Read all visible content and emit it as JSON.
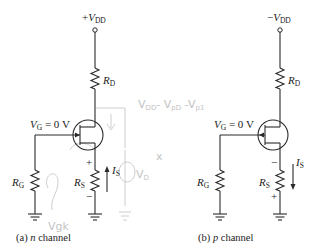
{
  "circuits": [
    {
      "id": "n-channel",
      "supply": {
        "sign": "+",
        "name": "V",
        "sub": "DD"
      },
      "drain_resistor": {
        "name": "R",
        "sub": "D"
      },
      "gate_label": {
        "name": "V",
        "sub": "G",
        "value": " = 0 V"
      },
      "gate_resistor": {
        "name": "R",
        "sub": "G"
      },
      "source_resistor": {
        "name": "R",
        "sub": "S",
        "top_polarity": "+",
        "bottom_polarity": "−"
      },
      "current": {
        "name": "I",
        "sub": "S",
        "direction": "up"
      },
      "caption": {
        "prefix": "(a) ",
        "type": "n",
        "suffix": " channel"
      }
    },
    {
      "id": "p-channel",
      "supply": {
        "sign": "−",
        "name": "V",
        "sub": "DD"
      },
      "drain_resistor": {
        "name": "R",
        "sub": "D"
      },
      "gate_label": {
        "name": "V",
        "sub": "G",
        "value": " = 0 V"
      },
      "gate_resistor": {
        "name": "R",
        "sub": "G"
      },
      "source_resistor": {
        "name": "R",
        "sub": "S",
        "top_polarity": "−",
        "bottom_polarity": "+"
      },
      "current": {
        "name": "I",
        "sub": "S",
        "direction": "down"
      },
      "caption": {
        "prefix": "(b) ",
        "type": "p",
        "suffix": " channel"
      }
    }
  ],
  "handwritten_annotations": {
    "equation": "V₀₀ - Vₚ₀ - Vₚ₁",
    "vd_label": "Vᴅ",
    "x_mark": "x",
    "vgk": "Vgk"
  }
}
